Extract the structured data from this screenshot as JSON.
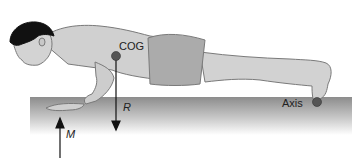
{
  "figure": {
    "labels": {
      "cog": "COG",
      "resistance": "R",
      "motive_force": "M",
      "axis": "Axis"
    },
    "colors": {
      "skin": "#cfcfcf",
      "skin_outline": "#7a7a7a",
      "shorts": "#a9a9a9",
      "hair": "#111111",
      "floor_top": "#8f8f8f",
      "floor_bottom": "#ffffff",
      "marker": "#555555",
      "arrow": "#111111"
    }
  }
}
